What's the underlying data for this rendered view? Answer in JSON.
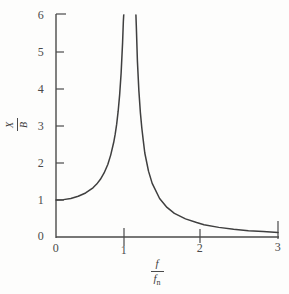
{
  "figure": {
    "name": "resonance-magnification-curve",
    "background_color": "#fdfdfc",
    "ink_color": "#4a4a4a"
  },
  "axes": {
    "x": {
      "label_numerator": "f",
      "label_denominator": "f",
      "label_denominator_sub": "n",
      "ticks": [
        "0",
        "1",
        "2",
        "3"
      ],
      "tick_values": [
        0,
        1,
        2,
        3
      ],
      "range": [
        0,
        3
      ],
      "pixel_origin_x": 56,
      "pixel_per_unit": 74
    },
    "y": {
      "label_numerator": "X",
      "label_denominator": "B",
      "ticks": [
        "0",
        "1",
        "2",
        "3",
        "4",
        "5",
        "6"
      ],
      "tick_values": [
        0,
        1,
        2,
        3,
        4,
        5,
        6
      ],
      "range": [
        0,
        6
      ],
      "pixel_origin_y": 237,
      "pixel_per_unit": 37
    }
  },
  "chart_data": {
    "type": "line",
    "title": "",
    "xlabel": "f / fn",
    "ylabel": "X / B",
    "xlim": [
      0,
      3
    ],
    "ylim": [
      0,
      6
    ],
    "grid": false,
    "legend": null,
    "annotations": [
      {
        "text": "vertical asymptote at f/fn = 1",
        "x": 1,
        "y": 6
      }
    ],
    "series": [
      {
        "name": "magnification-factor-left-branch",
        "comment": "1/(1-r^2) for r < 1, rises from 1 at r=0 to +infinity at r=1",
        "x": [
          0.0,
          0.1,
          0.2,
          0.3,
          0.4,
          0.5,
          0.55,
          0.6,
          0.65,
          0.7,
          0.74,
          0.78,
          0.8,
          0.82,
          0.84,
          0.86,
          0.88,
          0.9,
          0.91,
          0.915,
          0.918
        ],
        "y": [
          1.0,
          1.01,
          1.04,
          1.1,
          1.19,
          1.33,
          1.43,
          1.56,
          1.73,
          1.96,
          2.22,
          2.56,
          2.78,
          3.05,
          3.4,
          3.84,
          4.43,
          5.26,
          5.82,
          6.0,
          6.0
        ]
      },
      {
        "name": "magnification-factor-right-branch",
        "comment": "1/(r^2-1) for r > 1, falls from +infinity at r=1 toward 0 at r=3",
        "x": [
          1.08,
          1.085,
          1.1,
          1.12,
          1.14,
          1.16,
          1.18,
          1.2,
          1.25,
          1.3,
          1.4,
          1.5,
          1.6,
          1.75,
          1.9,
          2.0,
          2.2,
          2.4,
          2.6,
          2.8,
          3.0
        ],
        "y": [
          6.0,
          5.72,
          4.76,
          3.95,
          3.37,
          2.94,
          2.6,
          2.27,
          1.78,
          1.45,
          1.04,
          0.8,
          0.64,
          0.49,
          0.39,
          0.333,
          0.26,
          0.21,
          0.17,
          0.146,
          0.125
        ]
      }
    ]
  }
}
